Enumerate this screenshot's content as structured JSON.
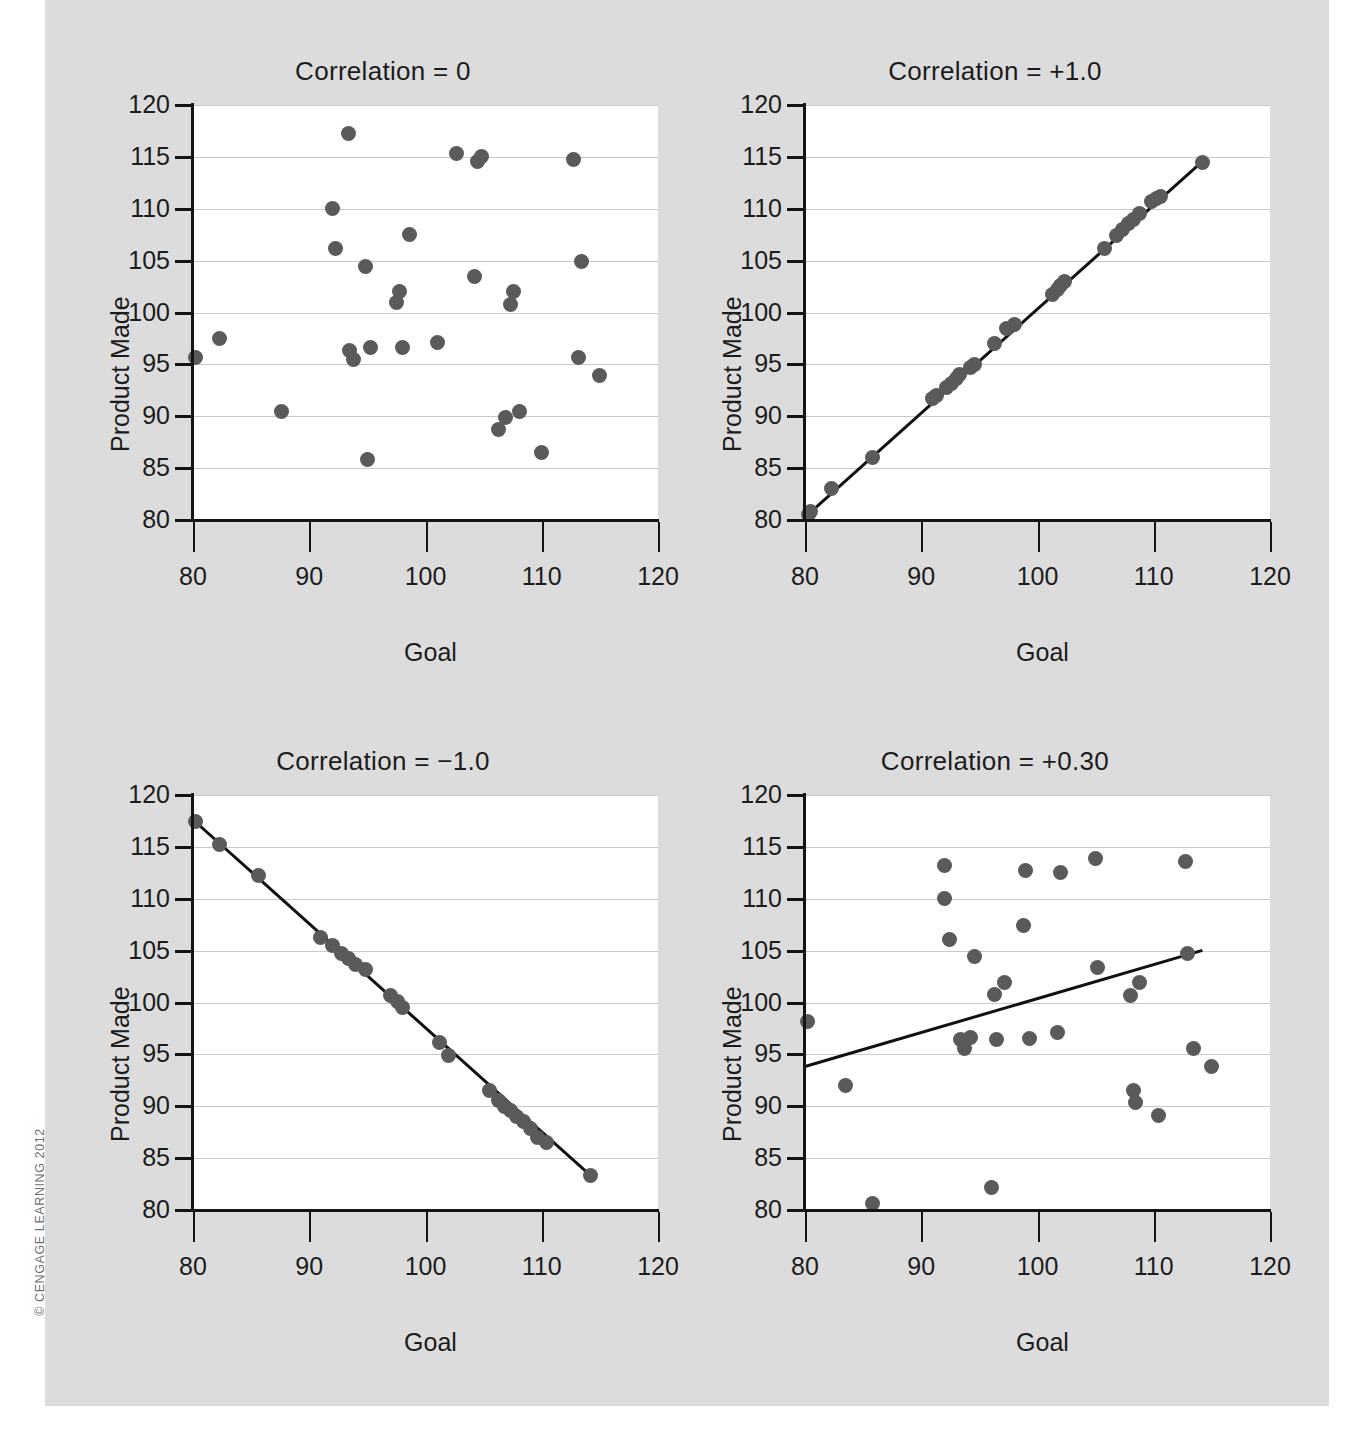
{
  "copyright": "© CENGAGE LEARNING 2012",
  "axis": {
    "xlabel": "Goal",
    "ylabel": "Product Made",
    "yticks": [
      80,
      85,
      90,
      95,
      100,
      105,
      110,
      115,
      120
    ],
    "xticks": [
      80,
      90,
      100,
      110,
      120
    ],
    "xlim": [
      80,
      120
    ],
    "ylim": [
      80,
      120
    ]
  },
  "chart_data": [
    {
      "type": "scatter",
      "title": "Correlation = 0",
      "xlabel": "Goal",
      "ylabel": "Product Made",
      "xlim": [
        80,
        120
      ],
      "ylim": [
        80,
        120
      ],
      "grid": true,
      "trendline": null,
      "points": [
        [
          80.2,
          95.7
        ],
        [
          82.3,
          97.5
        ],
        [
          87.6,
          90.5
        ],
        [
          92.0,
          110.0
        ],
        [
          92.3,
          106.2
        ],
        [
          93.4,
          117.3
        ],
        [
          93.5,
          96.3
        ],
        [
          93.8,
          95.5
        ],
        [
          94.8,
          104.4
        ],
        [
          95.0,
          85.8
        ],
        [
          95.3,
          96.6
        ],
        [
          97.5,
          101.0
        ],
        [
          97.8,
          102.0
        ],
        [
          98.0,
          96.6
        ],
        [
          98.6,
          107.5
        ],
        [
          101.0,
          97.1
        ],
        [
          102.7,
          115.3
        ],
        [
          104.2,
          103.5
        ],
        [
          104.5,
          114.6
        ],
        [
          104.8,
          115.0
        ],
        [
          106.3,
          88.7
        ],
        [
          106.9,
          89.9
        ],
        [
          107.3,
          100.8
        ],
        [
          107.6,
          102.0
        ],
        [
          108.1,
          90.5
        ],
        [
          110.0,
          86.5
        ],
        [
          112.7,
          114.7
        ],
        [
          113.2,
          95.7
        ],
        [
          113.4,
          104.9
        ],
        [
          115.0,
          93.9
        ]
      ]
    },
    {
      "type": "scatter",
      "title": "Correlation = +1.0",
      "xlabel": "Goal",
      "ylabel": "Product Made",
      "xlim": [
        80,
        120
      ],
      "ylim": [
        80,
        120
      ],
      "grid": true,
      "trendline": {
        "x0": 80.3,
        "y0": 80.5,
        "x1": 114.2,
        "y1": 114.5
      },
      "points": [
        [
          80.3,
          80.5
        ],
        [
          80.5,
          80.8
        ],
        [
          82.3,
          83.0
        ],
        [
          85.8,
          86.0
        ],
        [
          91.0,
          91.7
        ],
        [
          91.3,
          92.0
        ],
        [
          92.2,
          92.8
        ],
        [
          92.6,
          93.2
        ],
        [
          93.0,
          93.6
        ],
        [
          93.3,
          94.0
        ],
        [
          94.2,
          94.7
        ],
        [
          94.6,
          95.0
        ],
        [
          96.3,
          97.0
        ],
        [
          97.3,
          98.5
        ],
        [
          98.0,
          98.8
        ],
        [
          101.3,
          101.7
        ],
        [
          101.7,
          102.2
        ],
        [
          102.0,
          102.6
        ],
        [
          102.3,
          103.0
        ],
        [
          105.8,
          106.2
        ],
        [
          106.8,
          107.4
        ],
        [
          107.3,
          108.0
        ],
        [
          107.8,
          108.6
        ],
        [
          108.3,
          109.0
        ],
        [
          108.8,
          109.5
        ],
        [
          109.8,
          110.7
        ],
        [
          110.2,
          111.0
        ],
        [
          110.6,
          111.2
        ],
        [
          114.2,
          114.5
        ]
      ]
    },
    {
      "type": "scatter",
      "title": "Correlation = −1.0",
      "xlabel": "Goal",
      "ylabel": "Product Made",
      "xlim": [
        80,
        120
      ],
      "ylim": [
        80,
        120
      ],
      "grid": true,
      "trendline": {
        "x0": 80.2,
        "y0": 117.4,
        "x1": 114.2,
        "y1": 83.3
      },
      "points": [
        [
          80.2,
          117.4
        ],
        [
          82.3,
          115.2
        ],
        [
          85.6,
          112.2
        ],
        [
          91.0,
          106.3
        ],
        [
          92.0,
          105.5
        ],
        [
          92.8,
          104.7
        ],
        [
          93.4,
          104.2
        ],
        [
          94.0,
          103.7
        ],
        [
          94.8,
          103.2
        ],
        [
          97.0,
          100.7
        ],
        [
          97.6,
          100.1
        ],
        [
          98.0,
          99.5
        ],
        [
          101.2,
          96.1
        ],
        [
          102.0,
          94.9
        ],
        [
          105.5,
          91.5
        ],
        [
          106.3,
          90.6
        ],
        [
          106.8,
          90.0
        ],
        [
          107.3,
          89.6
        ],
        [
          107.8,
          89.0
        ],
        [
          108.4,
          88.5
        ],
        [
          109.0,
          87.9
        ],
        [
          109.6,
          87.0
        ],
        [
          110.4,
          86.5
        ],
        [
          114.2,
          83.3
        ]
      ]
    },
    {
      "type": "scatter",
      "title": "Correlation = +0.30",
      "xlabel": "Goal",
      "ylabel": "Product Made",
      "xlim": [
        80,
        120
      ],
      "ylim": [
        80,
        120
      ],
      "grid": true,
      "trendline": {
        "x0": 80.0,
        "y0": 93.8,
        "x1": 114.2,
        "y1": 105.0
      },
      "points": [
        [
          80.2,
          98.2
        ],
        [
          83.5,
          92.0
        ],
        [
          85.8,
          80.6
        ],
        [
          92.0,
          113.2
        ],
        [
          92.0,
          110.0
        ],
        [
          92.4,
          106.1
        ],
        [
          93.4,
          96.4
        ],
        [
          93.7,
          95.6
        ],
        [
          94.2,
          96.6
        ],
        [
          94.6,
          104.4
        ],
        [
          96.0,
          82.2
        ],
        [
          96.3,
          100.8
        ],
        [
          96.5,
          96.4
        ],
        [
          97.2,
          101.9
        ],
        [
          98.8,
          107.4
        ],
        [
          99.0,
          112.7
        ],
        [
          99.3,
          96.5
        ],
        [
          101.7,
          97.1
        ],
        [
          102.0,
          112.5
        ],
        [
          105.0,
          113.9
        ],
        [
          105.2,
          103.4
        ],
        [
          108.0,
          100.7
        ],
        [
          108.3,
          91.5
        ],
        [
          108.4,
          90.4
        ],
        [
          108.8,
          101.9
        ],
        [
          110.4,
          89.1
        ],
        [
          112.7,
          113.6
        ],
        [
          112.9,
          104.7
        ],
        [
          113.4,
          95.6
        ],
        [
          115.0,
          93.8
        ]
      ]
    }
  ]
}
